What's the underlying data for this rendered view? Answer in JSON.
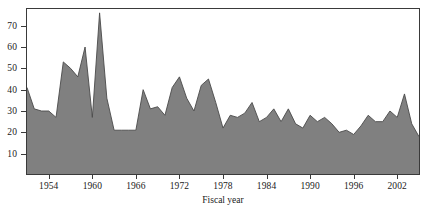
{
  "chart_data": {
    "type": "area",
    "title": "",
    "xlabel": "Fiscal year",
    "ylabel": "",
    "xlim": [
      1951,
      2005
    ],
    "ylim": [
      0,
      78
    ],
    "grid": false,
    "legend": null,
    "fill_color": "#808080",
    "line_color": "#4a4a4a",
    "background_color": "#ffffff",
    "frame_color": "#3a3a3a",
    "y_ticks": [
      10,
      20,
      30,
      40,
      50,
      60,
      70
    ],
    "y_tick_labels": [
      "10",
      "20",
      "30",
      "40",
      "50",
      "60",
      "70"
    ],
    "x_ticks": [
      1954,
      1960,
      1966,
      1972,
      1978,
      1984,
      1990,
      1996,
      2002
    ],
    "x_tick_labels": [
      "1954",
      "1960",
      "1966",
      "1972",
      "1978",
      "1984",
      "1990",
      "1996",
      "2002"
    ],
    "x": [
      1951,
      1952,
      1953,
      1954,
      1955,
      1956,
      1957,
      1958,
      1959,
      1960,
      1961,
      1962,
      1963,
      1964,
      1965,
      1966,
      1967,
      1968,
      1969,
      1970,
      1971,
      1972,
      1973,
      1974,
      1975,
      1976,
      1977,
      1978,
      1979,
      1980,
      1981,
      1982,
      1983,
      1984,
      1985,
      1986,
      1987,
      1988,
      1989,
      1990,
      1991,
      1992,
      1993,
      1994,
      1995,
      1996,
      1997,
      1998,
      1999,
      2000,
      2001,
      2002,
      2003,
      2004,
      2005
    ],
    "values": [
      41,
      31,
      30,
      30,
      27,
      53,
      50,
      46,
      60,
      27,
      76,
      36,
      21,
      21,
      21,
      21,
      40,
      31,
      32,
      28,
      41,
      46,
      36,
      30,
      42,
      45,
      34,
      22,
      28,
      27,
      29,
      34,
      25,
      27,
      31,
      25,
      31,
      24,
      22,
      28,
      25,
      27,
      24,
      20,
      21,
      19,
      23,
      28,
      25,
      25,
      30,
      27,
      38,
      24,
      18
    ],
    "series": [
      {
        "name": "Fiscal year series",
        "values": [
          41,
          31,
          30,
          30,
          27,
          53,
          50,
          46,
          60,
          27,
          76,
          36,
          21,
          21,
          21,
          21,
          40,
          31,
          32,
          28,
          41,
          46,
          36,
          30,
          42,
          45,
          34,
          22,
          28,
          27,
          29,
          34,
          25,
          27,
          31,
          25,
          31,
          24,
          22,
          28,
          25,
          27,
          24,
          20,
          21,
          19,
          23,
          28,
          25,
          25,
          30,
          27,
          38,
          24,
          18
        ]
      }
    ]
  }
}
